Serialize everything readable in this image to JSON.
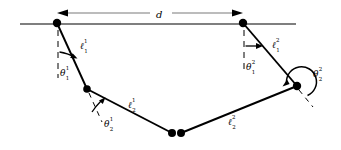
{
  "figure": {
    "type": "kinematic-diagram",
    "stroke_color": "#000000",
    "baseline_color": "#555555",
    "background": "#ffffff"
  },
  "labels": {
    "separation": {
      "base": "d",
      "sup": "",
      "sub": "",
      "name": "base-separation-distance"
    },
    "link_1_arm1": {
      "base": "ℓ",
      "sup": "1",
      "sub": "1",
      "name": "link-length-l-1-1"
    },
    "link_2_arm1": {
      "base": "ℓ",
      "sup": "1",
      "sub": "2",
      "name": "link-length-l-2-1"
    },
    "link_1_arm2": {
      "base": "ℓ",
      "sup": "2",
      "sub": "1",
      "name": "link-length-l-1-2"
    },
    "link_2_arm2": {
      "base": "ℓ",
      "sup": "2",
      "sub": "2",
      "name": "link-length-l-2-2"
    },
    "angle_1_arm1": {
      "base": "θ",
      "sup": "1",
      "sub": "1",
      "name": "joint-angle-theta-1-1"
    },
    "angle_2_arm1": {
      "base": "θ",
      "sup": "1",
      "sub": "2",
      "name": "joint-angle-theta-2-1"
    },
    "angle_1_arm2": {
      "base": "θ",
      "sup": "2",
      "sub": "1",
      "name": "joint-angle-theta-1-2"
    },
    "angle_2_arm2": {
      "base": "θ",
      "sup": "2",
      "sub": "2",
      "name": "joint-angle-theta-2-2"
    }
  },
  "geometry": {
    "baseline": {
      "x1": 20,
      "y1": 24,
      "x2": 296,
      "y2": 24
    },
    "dimension_line": {
      "x1": 57,
      "y1": 13,
      "x2": 243,
      "y2": 13
    },
    "joints": {
      "shoulder_arm1": {
        "x": 57,
        "y": 23,
        "r": 4.2
      },
      "elbow_arm1": {
        "x": 87,
        "y": 89,
        "r": 3.8
      },
      "hand_arm1": {
        "x": 172,
        "y": 133,
        "r": 4.0
      },
      "hand_arm2": {
        "x": 181,
        "y": 133,
        "r": 4.0
      },
      "elbow_arm2": {
        "x": 297,
        "y": 86,
        "r": 4.2
      },
      "shoulder_arm2": {
        "x": 243,
        "y": 23,
        "r": 4.2
      }
    }
  }
}
